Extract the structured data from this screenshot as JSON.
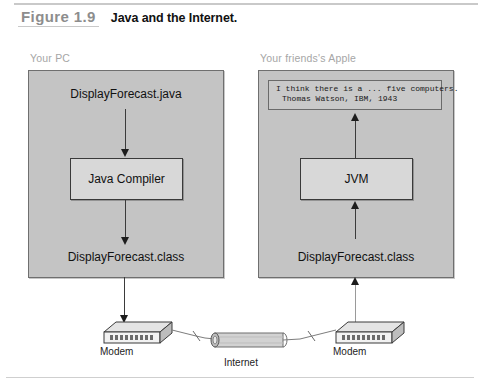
{
  "figure": {
    "label": "Figure 1.9",
    "title": "Java and the Internet."
  },
  "panels": {
    "left": {
      "caption": "Your PC",
      "source_file": "DisplayForecast.java",
      "compiler_box": "Java Compiler",
      "class_file": "DisplayForecast.class"
    },
    "right": {
      "caption": "Your friends's Apple",
      "console": {
        "line1": "I think there is a ... five computers.",
        "line2": "Thomas Watson, IBM, 1943"
      },
      "jvm_box": "JVM",
      "class_file": "DisplayForecast.class"
    }
  },
  "network": {
    "modem_left": "Modem",
    "modem_right": "Modem",
    "internet": "Internet"
  },
  "colors": {
    "panel_fill": "#c4c4c4",
    "panel_border": "#6f6f6f",
    "box_fill": "#d8d8d8",
    "box_border": "#3a3a3a",
    "caption_gray": "#a6a6a6",
    "label_gray": "#8d8d8d",
    "text_black": "#111111"
  }
}
